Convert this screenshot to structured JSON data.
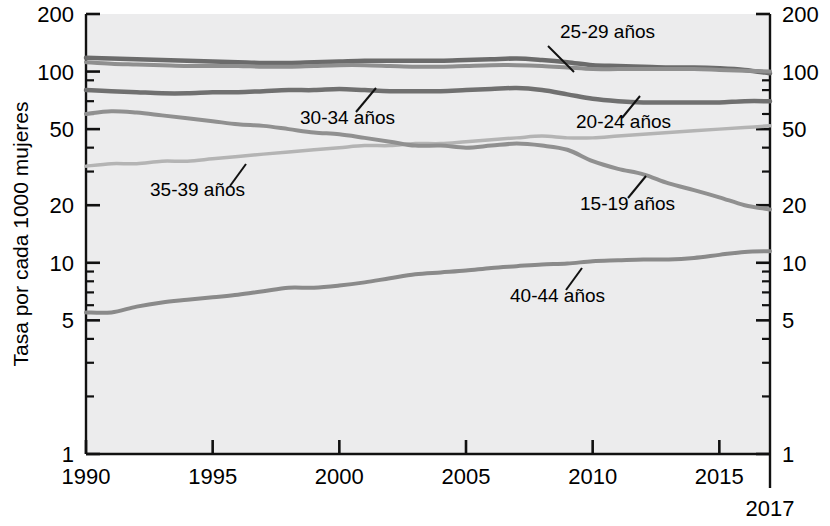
{
  "chart_data": {
    "type": "line",
    "title": "",
    "xlabel": "",
    "ylabel": "Tasa por cada 1000 mujeres",
    "yscale": "log",
    "ylim": [
      1,
      200
    ],
    "xlim": [
      1990,
      2017
    ],
    "grid": false,
    "legend_position": "inline-annotations",
    "y_ticks": [
      "200",
      "100",
      "50",
      "20",
      "10",
      "5",
      "1"
    ],
    "y_tick_values": [
      200,
      100,
      50,
      20,
      10,
      5,
      1
    ],
    "y_minor_tick_values": [
      90,
      80,
      70,
      60,
      40,
      30,
      9,
      8,
      7,
      6,
      4,
      3,
      2
    ],
    "x_ticks": [
      "1990",
      "1995",
      "2000",
      "2005",
      "2010",
      "2015"
    ],
    "x_tick_values": [
      1990,
      1995,
      2000,
      2005,
      2010,
      2015
    ],
    "x_end_label": "2017",
    "x": [
      1990,
      1991,
      1992,
      1993,
      1994,
      1995,
      1996,
      1997,
      1998,
      1999,
      2000,
      2001,
      2002,
      2003,
      2004,
      2005,
      2006,
      2007,
      2008,
      2009,
      2010,
      2011,
      2012,
      2013,
      2014,
      2015,
      2016,
      2017
    ],
    "series": [
      {
        "name": "25-29 años",
        "label": "25-29 años",
        "color": "#6b6b6b",
        "width": 4.5,
        "label_x": 560,
        "label_y": 38,
        "leader": [
          [
            548,
            46
          ],
          [
            574,
            72
          ]
        ],
        "values": [
          118,
          117,
          116,
          115,
          114,
          113,
          112,
          111,
          111,
          112,
          113,
          114,
          114,
          114,
          114,
          115,
          116,
          117,
          115,
          112,
          108,
          107,
          106,
          105,
          105,
          104,
          102,
          98
        ]
      },
      {
        "name": "30-34 años",
        "label": "30-34 años",
        "color": "#8f8f8f",
        "width": 4.0,
        "label_x": 300,
        "label_y": 124,
        "leader": [
          [
            356,
            112
          ],
          [
            376,
            88
          ]
        ],
        "values": [
          112,
          110,
          109,
          108,
          107,
          107,
          107,
          106,
          106,
          107,
          108,
          108,
          107,
          106,
          106,
          107,
          108,
          108,
          107,
          105,
          103,
          103,
          103,
          103,
          103,
          102,
          101,
          100
        ]
      },
      {
        "name": "20-24 años",
        "label": "20-24 años",
        "color": "#707070",
        "width": 4.5,
        "label_x": 576,
        "label_y": 128,
        "leader": [
          [
            622,
            118
          ],
          [
            640,
            96
          ]
        ],
        "values": [
          80,
          79,
          78,
          77,
          77,
          78,
          78,
          79,
          80,
          80,
          81,
          80,
          79,
          79,
          79,
          80,
          81,
          82,
          80,
          76,
          72,
          70,
          69,
          69,
          69,
          69,
          70,
          70
        ]
      },
      {
        "name": "35-39 años",
        "label": "35-39 años",
        "color": "#b4b4b4",
        "width": 3.5,
        "label_x": 150,
        "label_y": 196,
        "leader": [
          [
            230,
            186
          ],
          [
            246,
            164
          ]
        ],
        "values": [
          32,
          33,
          33,
          34,
          34,
          35,
          36,
          37,
          38,
          39,
          40,
          41,
          41,
          42,
          42,
          43,
          44,
          45,
          46,
          45,
          45,
          46,
          47,
          48,
          49,
          50,
          51,
          52
        ]
      },
      {
        "name": "15-19 años",
        "label": "15-19 años",
        "color": "#909090",
        "width": 4.0,
        "label_x": 580,
        "label_y": 210,
        "leader": [
          [
            628,
            198
          ],
          [
            646,
            176
          ]
        ],
        "values": [
          60,
          62,
          61,
          59,
          57,
          55,
          53,
          52,
          50,
          48,
          47,
          45,
          43,
          41,
          41,
          40,
          41,
          42,
          41,
          39,
          34,
          31,
          29,
          26,
          24,
          22,
          20,
          19
        ]
      },
      {
        "name": "40-44 años",
        "label": "40-44 años",
        "color": "#8a8a8a",
        "width": 4.0,
        "label_x": 510,
        "label_y": 302,
        "leader": [
          [
            566,
            290
          ],
          [
            582,
            268
          ]
        ],
        "values": [
          5.5,
          5.5,
          5.9,
          6.2,
          6.4,
          6.6,
          6.8,
          7.1,
          7.4,
          7.4,
          7.6,
          7.9,
          8.3,
          8.7,
          8.9,
          9.1,
          9.4,
          9.6,
          9.8,
          9.9,
          10.2,
          10.3,
          10.4,
          10.4,
          10.6,
          11.0,
          11.4,
          11.5
        ]
      }
    ]
  },
  "axis": {
    "ylabel": "Tasa por cada 1000 mujeres",
    "end_year": "2017"
  }
}
